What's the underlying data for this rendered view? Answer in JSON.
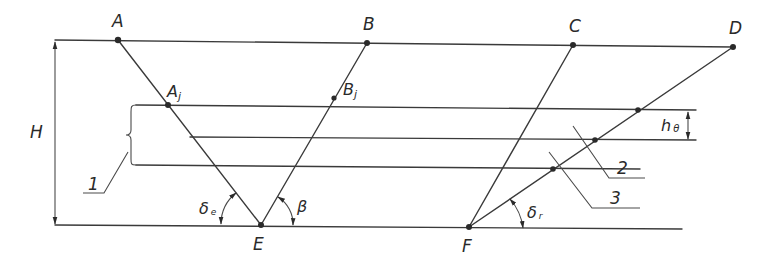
{
  "diagram": {
    "type": "geometric construction",
    "points": {
      "A": "A",
      "B": "B",
      "C": "C",
      "D": "D",
      "E": "E",
      "F": "F",
      "Aj_main": "A",
      "Aj_sub": "j",
      "Bj_main": "B",
      "Bj_sub": "j"
    },
    "dimensions": {
      "height": "H",
      "h_main": "h",
      "h_sub": "θ"
    },
    "angles": {
      "delta_e_main": "δ",
      "delta_e_sub": "e",
      "beta": "β",
      "delta_r_main": "δ",
      "delta_r_sub": "r"
    },
    "callouts": {
      "one": "1",
      "two": "2",
      "three": "3"
    },
    "colors": {
      "line": "#3a3a3a",
      "background": "#ffffff"
    }
  }
}
